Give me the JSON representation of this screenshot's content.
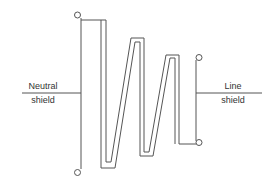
{
  "diagram": {
    "type": "grounding-electrode shield connection",
    "left_label": {
      "line1": "Neutral",
      "line2": "shield"
    },
    "right_label": {
      "line1": "Line",
      "line2": "shield"
    },
    "terminals": 4,
    "stroke_color": "#555555",
    "text_color": "#333333"
  }
}
